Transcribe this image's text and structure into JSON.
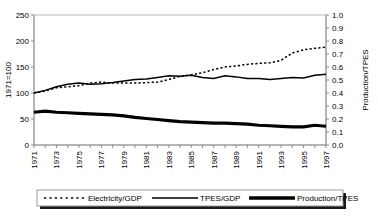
{
  "chart_data": {
    "type": "line",
    "title": "",
    "xlabel": "",
    "ylabel": "1971=100",
    "y2label": "Production/TPES",
    "x": [
      1971,
      1972,
      1973,
      1974,
      1975,
      1976,
      1977,
      1978,
      1979,
      1980,
      1981,
      1982,
      1983,
      1984,
      1985,
      1986,
      1987,
      1988,
      1989,
      1990,
      1991,
      1992,
      1993,
      1994,
      1995,
      1996,
      1997
    ],
    "xtick_labels": [
      "1971",
      "1973",
      "1975",
      "1977",
      "1979",
      "1981",
      "1983",
      "1985",
      "1987",
      "1989",
      "1991",
      "1993",
      "1995",
      "1997"
    ],
    "xlim": [
      1971,
      1997
    ],
    "ylim": [
      0,
      250
    ],
    "yticks": [
      0,
      50,
      100,
      150,
      200,
      250
    ],
    "ytick_labels": [
      "0",
      "50",
      "100",
      "150",
      "200",
      "250"
    ],
    "y2lim": [
      0.0,
      1.0
    ],
    "y2ticks": [
      0.0,
      0.1,
      0.2,
      0.3,
      0.4,
      0.5,
      0.6,
      0.7,
      0.8,
      0.9,
      1.0
    ],
    "y2tick_labels": [
      "0.0",
      "0.1",
      "0.2",
      "0.3",
      "0.4",
      "0.5",
      "0.6",
      "0.7",
      "0.8",
      "0.9",
      "1.0"
    ],
    "grid": false,
    "legend_position": "bottom",
    "series": [
      {
        "name": "Electricity/GDP",
        "style": "dotted",
        "axis": "left",
        "values": [
          100,
          104,
          110,
          112,
          114,
          119,
          121,
          119,
          119,
          119,
          120,
          121,
          126,
          132,
          135,
          139,
          145,
          150,
          152,
          155,
          157,
          158,
          163,
          177,
          183,
          186,
          188
        ]
      },
      {
        "name": "TPES/GDP",
        "style": "thin-solid",
        "axis": "left",
        "values": [
          100,
          105,
          112,
          117,
          119,
          117,
          118,
          120,
          123,
          126,
          127,
          130,
          133,
          132,
          134,
          130,
          128,
          133,
          131,
          128,
          128,
          126,
          128,
          130,
          129,
          134,
          136
        ]
      },
      {
        "name": "Production/TPES",
        "style": "thick-solid",
        "axis": "left",
        "values": [
          63,
          65,
          63,
          62,
          61,
          60,
          59,
          58,
          56,
          53,
          51,
          49,
          47,
          45,
          44,
          43,
          42,
          42,
          41,
          40,
          38,
          37,
          36,
          35,
          35,
          38,
          36
        ]
      }
    ]
  },
  "legend": {
    "entries": [
      {
        "label": "Electricity/GDP",
        "style": "dotted"
      },
      {
        "label": "TPES/GDP",
        "style": "thin-solid"
      },
      {
        "label": "Production/TPES",
        "style": "thick-solid"
      }
    ]
  }
}
